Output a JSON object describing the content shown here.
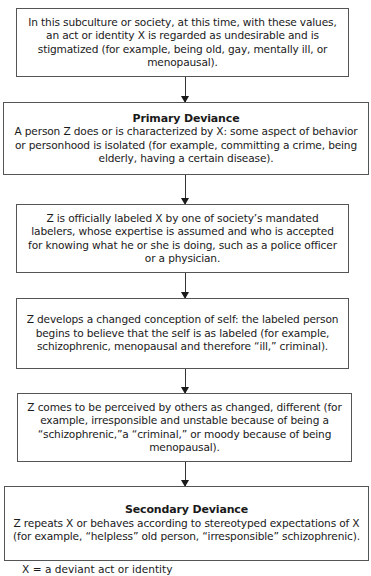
{
  "diagram": {
    "boxes": [
      {
        "title": "",
        "text": "In this subculture or society, at this time, with these values, an act or identity X is regarded as undesirable and is stigmatized (for example, being old, gay, mentally ill, or menopausal)."
      },
      {
        "title": "Primary Deviance",
        "text": "A person Z does or is characterized by X: some aspect of behavior or personhood is isolated (for example, committing a crime, being elderly, having a certain disease)."
      },
      {
        "title": "",
        "text": "Z is officially labeled X by one of society’s mandated labelers, whose expertise is assumed and who is accepted for knowing what he or she is doing, such as a police officer or a physician."
      },
      {
        "title": "",
        "text": "Z develops a changed conception of self: the labeled person begins to believe that the self is as labeled (for example, schizophrenic, menopausal and therefore “ill,” criminal)."
      },
      {
        "title": "",
        "text": "Z comes to be perceived by others as changed, different (for example, irresponsible and unstable because of being a “schizophrenic,”a “criminal,” or moody because of being menopausal)."
      },
      {
        "title": "Secondary Deviance",
        "text": "Z repeats X or behaves according to stereotyped expectations of X (for example, “helpless” old person, “irresponsible” schizophrenic)."
      }
    ],
    "arrow_count": 5,
    "footnote": {
      "visible_text": "X … a deviant act or identity",
      "symbol": "X",
      "connector": "=",
      "connector_verified": false,
      "definition": "a deviant act or identity",
      "clipped": true
    }
  }
}
